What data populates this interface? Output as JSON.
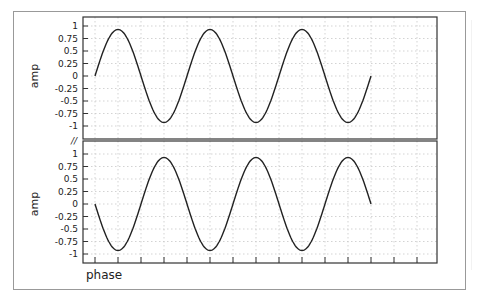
{
  "chart_data": {
    "type": "line",
    "layout": "two vertically stacked panels sharing x-axis",
    "grid": true,
    "legend": "none",
    "xlabel": "phase",
    "x_tick_count": 16,
    "x_tick_labels": [],
    "panels": [
      {
        "name": "top",
        "ylabel": "amp",
        "ylim": [
          -1.1,
          1.05
        ],
        "yticks": [
          1,
          0.75,
          0.5,
          0.25,
          0,
          -0.25,
          -0.5,
          -0.75,
          -1
        ],
        "ytick_labels": [
          "1",
          "0.75",
          "0.5",
          "0.25",
          "0",
          "-0.25",
          "-0.5",
          "-0.75",
          "-1"
        ],
        "series": [
          {
            "name": "sine",
            "function": "0.93*sin(phase)",
            "amplitude": 0.93,
            "periods": 3,
            "start_value": 0,
            "end_value": 0,
            "color": "#222222"
          }
        ]
      },
      {
        "name": "bottom",
        "ylabel": "amp",
        "ylim": [
          -1.1,
          1.05
        ],
        "yticks": [
          1,
          0.75,
          0.5,
          0.25,
          0,
          -0.25,
          -0.5,
          -0.75,
          -1
        ],
        "ytick_labels": [
          "1",
          "0.75",
          "0.5",
          "0.25",
          "0",
          "-0.25",
          "-0.5",
          "-0.75",
          "-1"
        ],
        "series": [
          {
            "name": "negative sine",
            "function": "-0.93*sin(phase)",
            "amplitude": 0.93,
            "periods": 3,
            "start_value": 0,
            "end_value": 0,
            "color": "#222222"
          }
        ]
      }
    ],
    "break_marker": "//"
  },
  "labels": {
    "top_ylabel": "amp",
    "bottom_ylabel": "amp",
    "xlabel": "phase",
    "break_marker": "//"
  },
  "colors": {
    "line": "#222222",
    "axis": "#333333",
    "grid": "#c8c8c8",
    "frame": "#999999"
  }
}
